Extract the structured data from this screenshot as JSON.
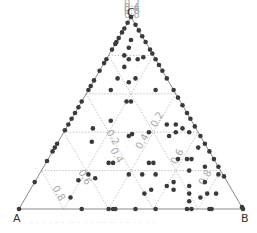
{
  "chart_data": {
    "type": "scatter",
    "subtype": "ternary",
    "title": "",
    "vertices": {
      "A": "A",
      "B": "B",
      "C": "C"
    },
    "axis_ticks": {
      "C": [
        "0.2",
        "0.4",
        "0.6",
        "0.8"
      ],
      "A": [
        "0.2",
        "0.4",
        "0.6",
        "0.8"
      ],
      "B": [
        "0.2",
        "0.4",
        "0.6",
        "0.8"
      ]
    },
    "grid": true,
    "grid_style": "dotted",
    "point_color": "#3a3a3a",
    "points_ternary_note": "each point = [a, b, c] fractions, a+b+c=1",
    "points": [
      [
        0.0,
        0.0,
        1.0
      ],
      [
        0.03,
        0.0,
        0.97
      ],
      [
        0.06,
        0.0,
        0.94
      ],
      [
        0.08,
        0.0,
        0.92
      ],
      [
        0.11,
        0.0,
        0.89
      ],
      [
        0.13,
        0.0,
        0.87
      ],
      [
        0.14,
        0.0,
        0.86
      ],
      [
        0.17,
        0.0,
        0.83
      ],
      [
        0.22,
        0.0,
        0.78
      ],
      [
        0.24,
        0.0,
        0.76
      ],
      [
        0.28,
        0.0,
        0.72
      ],
      [
        0.33,
        0.0,
        0.67
      ],
      [
        0.36,
        0.0,
        0.64
      ],
      [
        0.38,
        0.0,
        0.62
      ],
      [
        0.44,
        0.0,
        0.56
      ],
      [
        0.47,
        0.0,
        0.53
      ],
      [
        0.5,
        0.0,
        0.5
      ],
      [
        0.53,
        0.0,
        0.47
      ],
      [
        0.56,
        0.0,
        0.44
      ],
      [
        0.59,
        0.0,
        0.41
      ],
      [
        0.66,
        0.0,
        0.34
      ],
      [
        0.68,
        0.0,
        0.32
      ],
      [
        0.7,
        0.0,
        0.3
      ],
      [
        0.75,
        0.0,
        0.25
      ],
      [
        0.86,
        0.0,
        0.14
      ],
      [
        0.0,
        0.04,
        0.96
      ],
      [
        0.0,
        0.07,
        0.93
      ],
      [
        0.0,
        0.1,
        0.9
      ],
      [
        0.0,
        0.13,
        0.87
      ],
      [
        0.0,
        0.17,
        0.83
      ],
      [
        0.0,
        0.19,
        0.81
      ],
      [
        0.0,
        0.22,
        0.78
      ],
      [
        0.0,
        0.25,
        0.75
      ],
      [
        0.0,
        0.28,
        0.72
      ],
      [
        0.0,
        0.32,
        0.68
      ],
      [
        0.0,
        0.38,
        0.62
      ],
      [
        0.0,
        0.42,
        0.58
      ],
      [
        0.0,
        0.46,
        0.54
      ],
      [
        0.0,
        0.5,
        0.5
      ],
      [
        0.0,
        0.53,
        0.47
      ],
      [
        0.0,
        0.57,
        0.43
      ],
      [
        0.0,
        0.62,
        0.38
      ],
      [
        0.0,
        0.66,
        0.34
      ],
      [
        0.0,
        0.7,
        0.3
      ],
      [
        0.0,
        0.74,
        0.26
      ],
      [
        0.0,
        0.78,
        0.22
      ],
      [
        0.0,
        0.83,
        0.17
      ],
      [
        0.0,
        0.99,
        0.01
      ],
      [
        0.72,
        0.28,
        0.0
      ],
      [
        0.6,
        0.4,
        0.0
      ],
      [
        0.58,
        0.42,
        0.0
      ],
      [
        0.57,
        0.43,
        0.0
      ],
      [
        0.48,
        0.52,
        0.0
      ],
      [
        0.39,
        0.61,
        0.0
      ],
      [
        0.25,
        0.75,
        0.0
      ],
      [
        0.23,
        0.77,
        0.0
      ],
      [
        0.15,
        0.85,
        0.0
      ],
      [
        0.14,
        0.86,
        0.0
      ],
      [
        0.0,
        1.0,
        0.0
      ],
      [
        1.0,
        0.0,
        0.0
      ],
      [
        0.06,
        0.06,
        0.88
      ],
      [
        0.09,
        0.07,
        0.84
      ],
      [
        0.12,
        0.1,
        0.78
      ],
      [
        0.08,
        0.14,
        0.78
      ],
      [
        0.05,
        0.16,
        0.79
      ],
      [
        0.13,
        0.07,
        0.8
      ],
      [
        0.16,
        0.1,
        0.74
      ],
      [
        0.22,
        0.1,
        0.68
      ],
      [
        0.28,
        0.1,
        0.62
      ],
      [
        0.14,
        0.18,
        0.68
      ],
      [
        0.18,
        0.16,
        0.66
      ],
      [
        0.08,
        0.3,
        0.62
      ],
      [
        0.24,
        0.2,
        0.56
      ],
      [
        0.22,
        0.22,
        0.56
      ],
      [
        0.36,
        0.18,
        0.46
      ],
      [
        0.46,
        0.12,
        0.42
      ],
      [
        0.5,
        0.15,
        0.35
      ],
      [
        0.32,
        0.3,
        0.38
      ],
      [
        0.3,
        0.31,
        0.39
      ],
      [
        0.22,
        0.38,
        0.4
      ],
      [
        0.12,
        0.44,
        0.44
      ],
      [
        0.06,
        0.52,
        0.42
      ],
      [
        0.1,
        0.5,
        0.4
      ],
      [
        0.14,
        0.48,
        0.38
      ],
      [
        0.08,
        0.48,
        0.44
      ],
      [
        0.04,
        0.56,
        0.4
      ],
      [
        0.48,
        0.28,
        0.24
      ],
      [
        0.46,
        0.3,
        0.24
      ],
      [
        0.6,
        0.22,
        0.18
      ],
      [
        0.66,
        0.19,
        0.15
      ],
      [
        0.58,
        0.26,
        0.16
      ],
      [
        0.3,
        0.46,
        0.24
      ],
      [
        0.28,
        0.48,
        0.24
      ],
      [
        0.16,
        0.58,
        0.26
      ],
      [
        0.12,
        0.62,
        0.26
      ],
      [
        0.1,
        0.64,
        0.26
      ],
      [
        0.3,
        0.52,
        0.18
      ],
      [
        0.36,
        0.46,
        0.18
      ],
      [
        0.36,
        0.54,
        0.1
      ],
      [
        0.4,
        0.52,
        0.08
      ],
      [
        0.28,
        0.6,
        0.12
      ],
      [
        0.24,
        0.62,
        0.14
      ],
      [
        0.26,
        0.64,
        0.1
      ],
      [
        0.2,
        0.72,
        0.08
      ],
      [
        0.18,
        0.7,
        0.12
      ],
      [
        0.12,
        0.8,
        0.08
      ],
      [
        0.1,
        0.76,
        0.14
      ],
      [
        0.22,
        0.74,
        0.04
      ],
      [
        0.16,
        0.78,
        0.06
      ],
      [
        0.08,
        0.84,
        0.08
      ],
      [
        0.74,
        0.2,
        0.06
      ],
      [
        0.42,
        0.4,
        0.18
      ],
      [
        0.02,
        0.8,
        0.18
      ],
      [
        0.06,
        0.72,
        0.22
      ],
      [
        0.14,
        0.66,
        0.2
      ],
      [
        0.04,
        0.64,
        0.32
      ]
    ]
  },
  "caption": "· ·  · ·  ·  · ··  · ·  ·  ···  ·· · ·  · ·  · ·"
}
